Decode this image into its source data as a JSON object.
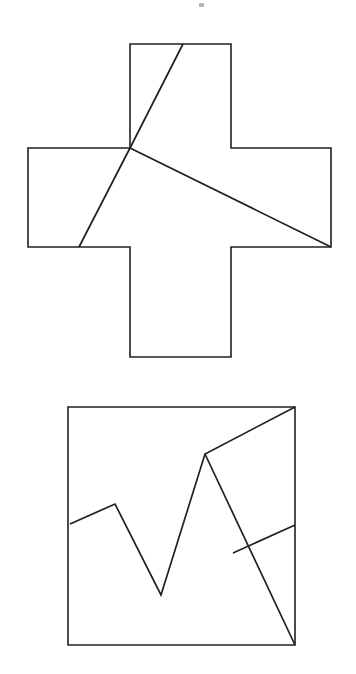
{
  "page": {
    "background_color": "#ffffff",
    "stroke_color": "#231f20",
    "width": 356,
    "height": 674
  },
  "figures": [
    {
      "name": "greek-cross-dissection",
      "shape": "greek-cross",
      "description": "Greek cross with two straight cut lines meeting at a point on the left re-entrant corner",
      "outline_points": "130,44 231,44 231,148 331,148 331,247 231,247 231,357 130,357 130,247 28,247 28,148 130,148",
      "bounds": {
        "left": 28,
        "top": 44,
        "right": 331,
        "bottom": 357
      },
      "arm_width": 101,
      "cut_lines": [
        {
          "name": "cut-line-upper",
          "from": [
            183,
            44
          ],
          "to": [
            79,
            247
          ],
          "via": [
            130,
            148
          ]
        },
        {
          "name": "cut-line-lower",
          "from": [
            130,
            148
          ],
          "to": [
            331,
            247
          ]
        }
      ],
      "junction_point": [
        130,
        148
      ]
    },
    {
      "name": "square-dissection",
      "shape": "square",
      "description": "Square containing a zigzag polyline and a crossing diagonal line",
      "outline_points": "68,407 295,407 295,645 68,645",
      "bounds": {
        "left": 68,
        "top": 407,
        "right": 295,
        "bottom": 645
      },
      "side_length": 228,
      "cut_lines": [
        {
          "name": "cut-polyline-zigzag",
          "points": "70,524 115,504 161,595 205,454 295,407"
        },
        {
          "name": "cut-line-diagonal",
          "from": [
            295,
            525
          ],
          "to": [
            295,
            645
          ],
          "via": [
            233,
            553
          ]
        }
      ],
      "crossing_point": [
        250,
        535
      ]
    }
  ],
  "artifacts": [
    {
      "name": "scan-speck-top",
      "x": 199,
      "y": 3,
      "width": 5,
      "height": 4
    }
  ]
}
